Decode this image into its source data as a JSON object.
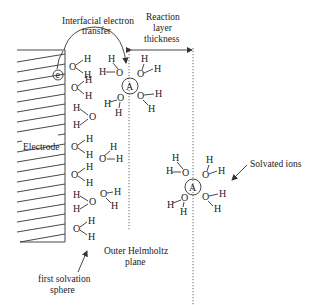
{
  "figure": {
    "labels": {
      "interfacial_1": "Interfacial electron",
      "interfacial_2": "transfer",
      "reaction_1": "Reaction",
      "reaction_2": "layer",
      "reaction_3": "thickness",
      "electrode": "Electrode",
      "solvated_ions": "Solvated ions",
      "outer_helmholtz_1": "Outer Helmholtz",
      "outer_helmholtz_2": "plane",
      "first_solvation_1": "first solvation",
      "first_solvation_2": "sphere"
    },
    "symbols": {
      "electron": "e",
      "ion_near": "A",
      "ion_far": "A",
      "oxygen": "O",
      "hydrogen": "H"
    },
    "colors": {
      "ink": "#222222",
      "background": "#ffffff"
    }
  }
}
